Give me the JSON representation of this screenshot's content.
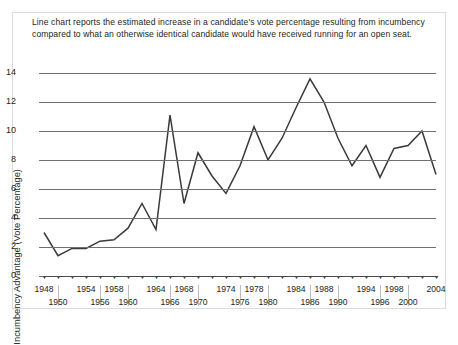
{
  "caption": "Line chart reports the estimated increase in a candidate's vote percentage resulting from incumbency compared to what an otherwise identical candidate would have received running for an open seat.",
  "axes": {
    "ylabel": "Incumbency Advantage (Vote Percentage)",
    "xlabel": "",
    "yticks": [
      0,
      2,
      4,
      6,
      8,
      10,
      12,
      14
    ],
    "ylim": [
      0,
      14.8
    ]
  },
  "colors": {
    "line": "#3a3a3a",
    "grid": "#6f6f6f",
    "axis": "#4a4a4a",
    "frame": "#dcdcdc",
    "text": "#231f20",
    "background": "#ffffff"
  },
  "chart_data": {
    "type": "line",
    "title": "",
    "xlabel": "",
    "ylabel": "Incumbency Advantage (Vote Percentage)",
    "xlim": [
      1948,
      2004
    ],
    "ylim": [
      0,
      14.8
    ],
    "grid": true,
    "legend": "none",
    "x": [
      1948,
      1950,
      1952,
      1954,
      1956,
      1958,
      1960,
      1962,
      1964,
      1966,
      1968,
      1970,
      1972,
      1974,
      1976,
      1978,
      1980,
      1982,
      1984,
      1986,
      1988,
      1990,
      1992,
      1994,
      1996,
      1998,
      2000,
      2002,
      2004
    ],
    "values": [
      3.0,
      1.4,
      1.9,
      1.9,
      2.4,
      2.5,
      3.3,
      5.0,
      3.2,
      11.1,
      5.0,
      8.5,
      6.9,
      5.7,
      7.6,
      10.3,
      8.0,
      9.5,
      11.6,
      13.6,
      12.0,
      9.5,
      7.6,
      9.0,
      6.8,
      8.8,
      9.0,
      10.0,
      7.0
    ],
    "categories": [
      "1948",
      "1950",
      "1952",
      "1954",
      "1956",
      "1958",
      "1960",
      "1962",
      "1964",
      "1966",
      "1968",
      "1970",
      "1972",
      "1974",
      "1976",
      "1978",
      "1980",
      "1982",
      "1984",
      "1986",
      "1988",
      "1990",
      "1992",
      "1994",
      "1996",
      "1998",
      "2000",
      "2002",
      "2004"
    ],
    "tick_labels_row1": [
      "1948",
      "1954",
      "1958",
      "1964",
      "1968",
      "1974",
      "1978",
      "1984",
      "1988",
      "1994",
      "1998",
      "2004"
    ],
    "tick_labels_row2": [
      "1950",
      "1956",
      "1960",
      "1966",
      "1970",
      "1976",
      "1980",
      "1986",
      "1990",
      "1996",
      "2000"
    ],
    "series": [
      {
        "name": "Incumbency Advantage",
        "values": [
          3.0,
          1.4,
          1.9,
          1.9,
          2.4,
          2.5,
          3.3,
          5.0,
          3.2,
          11.1,
          5.0,
          8.5,
          6.9,
          5.7,
          7.6,
          10.3,
          8.0,
          9.5,
          11.6,
          13.6,
          12.0,
          9.5,
          7.6,
          9.0,
          6.8,
          8.8,
          9.0,
          10.0,
          7.0
        ]
      }
    ]
  }
}
